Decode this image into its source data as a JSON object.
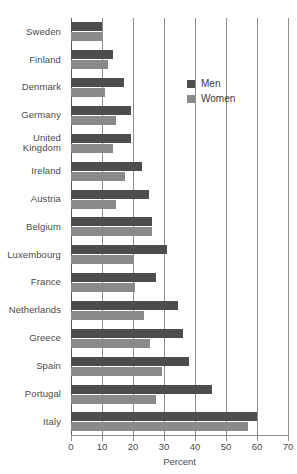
{
  "chart_data": {
    "type": "bar",
    "orientation": "horizontal",
    "title": "",
    "xlabel": "Percent",
    "ylabel": "",
    "xlim": [
      0,
      70
    ],
    "xticks": [
      0,
      10,
      20,
      30,
      40,
      50,
      60,
      70
    ],
    "xtick_labels": [
      "0",
      "10",
      "20",
      "30",
      "40",
      "50",
      "60",
      "70"
    ],
    "grid": true,
    "grid_axis": "x",
    "legend_position": "upper-right-inside",
    "categories": [
      "Sweden",
      "Finland",
      "Denmark",
      "Germany",
      "United\nKingdom",
      "Ireland",
      "Austria",
      "Belgium",
      "Luxembourg",
      "France",
      "Netherlands",
      "Greece",
      "Spain",
      "Portugal",
      "Italy"
    ],
    "series": [
      {
        "name": "Men",
        "color": "#4d4d4d",
        "values": [
          10.0,
          13.5,
          17.0,
          19.5,
          19.5,
          23.0,
          25.0,
          26.0,
          31.0,
          27.5,
          34.5,
          36.0,
          38.0,
          45.5,
          60.0
        ]
      },
      {
        "name": "Women",
        "color": "#8a8a8a",
        "values": [
          10.0,
          12.0,
          11.0,
          14.5,
          13.5,
          17.5,
          14.5,
          26.0,
          20.0,
          20.5,
          23.5,
          25.5,
          29.5,
          27.5,
          57.0
        ]
      }
    ]
  },
  "legend": {
    "items": [
      {
        "label": "Men",
        "key": "men"
      },
      {
        "label": "Women",
        "key": "women"
      }
    ]
  },
  "colors": {
    "men": "#4d4d4d",
    "women": "#8a8a8a",
    "grid": "#8d8d8d",
    "text": "#4a4a4a",
    "background": "#ffffff"
  }
}
